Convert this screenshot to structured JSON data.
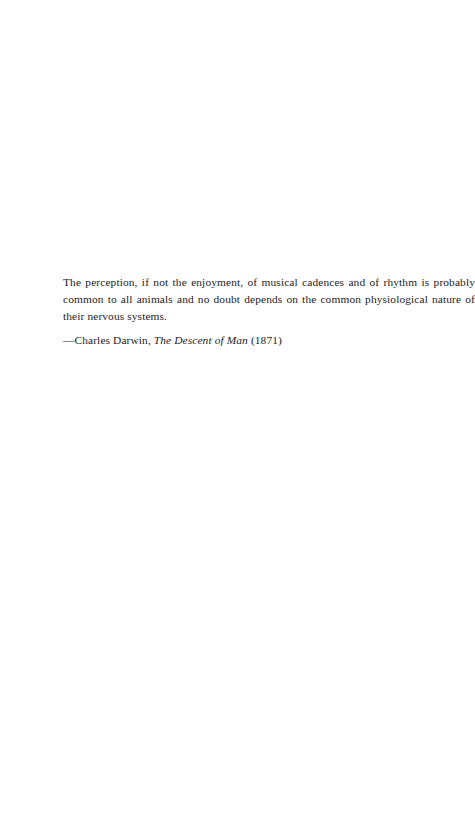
{
  "page": {
    "background_color": "#ffffff",
    "text_color": "#1c1c1c",
    "width": 458,
    "height": 840
  },
  "epigraph": {
    "quote": "The perception, if not the enjoyment, of musical cadences and of rhythm is probably common to all animals and no doubt depends on the common physiological nature of their nervous systems.",
    "attribution": {
      "dash_and_author": "—Charles Darwin, ",
      "work_title": "The Descent of Man",
      "year": " (1871)"
    }
  }
}
